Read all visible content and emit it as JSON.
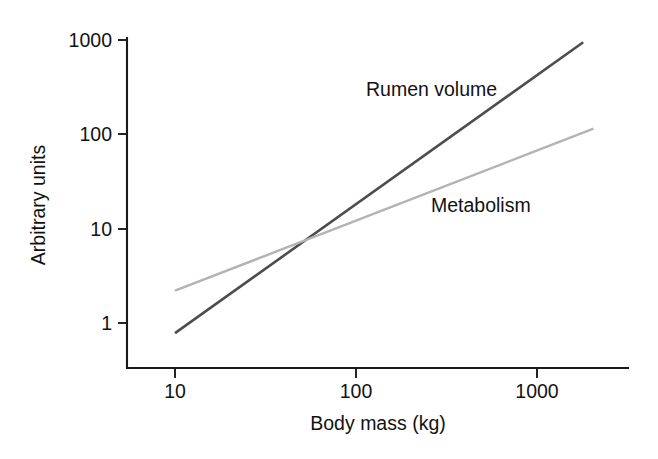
{
  "figure": {
    "background_color": "#ffffff",
    "text_color": "#121212",
    "axis_color": "#1a1a1a"
  },
  "chart_data": {
    "type": "line",
    "title": "",
    "subtitle": "",
    "xlabel": "Body mass (kg)",
    "ylabel": "Arbitrary units",
    "xscale": "log",
    "yscale": "log",
    "xlim": [
      7,
      2400
    ],
    "ylim": [
      0.55,
      1400
    ],
    "xticks": [
      10,
      100,
      1000
    ],
    "xtick_labels": [
      "10",
      "100",
      "1000"
    ],
    "yticks": [
      1,
      10,
      100,
      1000
    ],
    "ytick_labels": [
      "1",
      "10",
      "100",
      "1000"
    ],
    "grid": false,
    "legend_position": "inline-annotation",
    "series": [
      {
        "name": "Rumen volume",
        "label": "Rumen volume",
        "color": "#4d4d4d",
        "linewidth": 2.6,
        "slope_loglog": 1.37,
        "x": [
          10,
          1800
        ],
        "y": [
          0.78,
          950
        ]
      },
      {
        "name": "Metabolism",
        "label": "Metabolism",
        "color": "#b3b3b3",
        "linewidth": 2.4,
        "slope_loglog": 0.75,
        "x": [
          10,
          2050
        ],
        "y": [
          2.2,
          115
        ]
      }
    ],
    "annotations": [
      {
        "text": "Rumen volume",
        "x": 95,
        "y": 290
      },
      {
        "text": "Metabolism",
        "x": 520,
        "y": 23
      }
    ]
  }
}
